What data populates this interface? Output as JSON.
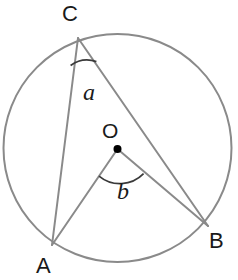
{
  "figure": {
    "kind": "circle-geometry-diagram",
    "width": 238,
    "height": 280,
    "background_color": "#ffffff",
    "stroke_color": "#8a8a8a",
    "text_color": "#1a1a1a",
    "dot_color": "#000000"
  },
  "circle": {
    "center_x": 117.5,
    "center_y": 148,
    "radius": 114,
    "stroke_width": 2
  },
  "points": {
    "C": {
      "label": "C",
      "x": 78,
      "y": 38
    },
    "A": {
      "label": "A",
      "x": 52,
      "y": 245
    },
    "B": {
      "label": "B",
      "x": 208,
      "y": 226
    },
    "O": {
      "label": "O",
      "x": 117.5,
      "y": 149,
      "dot_radius": 4
    }
  },
  "segments": [
    {
      "name": "chord-CA",
      "from": "C",
      "to": "A",
      "x1": 78,
      "y1": 38,
      "x2": 52,
      "y2": 245
    },
    {
      "name": "chord-CB",
      "from": "C",
      "to": "B",
      "x1": 78,
      "y1": 38,
      "x2": 208,
      "y2": 226
    },
    {
      "name": "radius-OA",
      "from": "O",
      "to": "A",
      "x1": 117.5,
      "y1": 149,
      "x2": 52,
      "y2": 245
    },
    {
      "name": "radius-OB",
      "from": "O",
      "to": "B",
      "x1": 117.5,
      "y1": 149,
      "x2": 208,
      "y2": 226
    }
  ],
  "angles": {
    "inscribed": {
      "label": "a",
      "vertex": "C",
      "arc_path": "M 70.6 65.5 A 28 28 0 0 1 96.4 61.6",
      "description": "inscribed angle ACB at C"
    },
    "central": {
      "label": "b",
      "vertex": "O",
      "arc_path": "M 99.0 176.1 A 33 33 0 0 0 143.6 173.7",
      "description": "central angle AOB at O"
    }
  }
}
